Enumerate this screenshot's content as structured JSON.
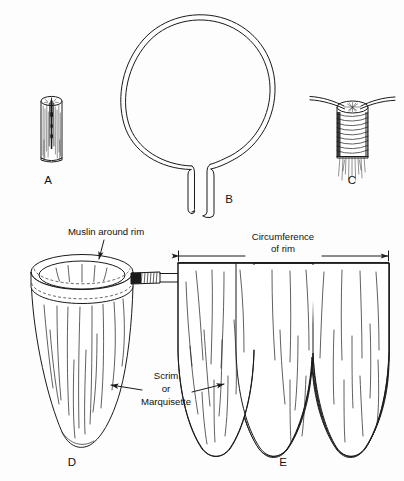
{
  "figure": {
    "kind": "technical-line-illustration",
    "background_color": "#fdfdfd",
    "ink_color": "#1a1a1a",
    "width": 404,
    "height": 481
  },
  "panels": [
    {
      "id": "A",
      "letter": "A",
      "name": "split-handle-end",
      "description": "Wooden handle end with sawn slot",
      "label_x": 48,
      "label_y": 181
    },
    {
      "id": "B",
      "letter": "B",
      "name": "wire-rim-hoop",
      "description": "Heavy wire bent into a rim hoop with two straight legs",
      "label_x": 229,
      "label_y": 200
    },
    {
      "id": "C",
      "letter": "C",
      "name": "wire-bound-to-handle",
      "description": "Wire legs seated in handle slot and bound with wire wrapping",
      "label_x": 352,
      "label_y": 181
    },
    {
      "id": "D",
      "letter": "D",
      "name": "assembled-net",
      "description": "Completed sweep net on rim and handle",
      "label_x": 72,
      "label_y": 463
    },
    {
      "id": "E",
      "letter": "E",
      "name": "net-bag-pattern",
      "description": "Flat cutting pattern for the net bag",
      "label_x": 283,
      "label_y": 463
    }
  ],
  "callouts": [
    {
      "id": "muslin",
      "name": "muslin-around-rim-callout",
      "text": "Muslin around rim",
      "text_x": 106,
      "text_y": 232,
      "arrow_from_x": 106,
      "arrow_from_y": 240,
      "arrow_to_x": 98,
      "arrow_to_y": 264
    },
    {
      "id": "scrim",
      "name": "scrim-or-marquisette-callout",
      "lines": [
        "Scrim",
        "or",
        "Marquisette"
      ],
      "text_x": 166,
      "text_y": 388,
      "line_height": 13,
      "arrow_left_from_x": 140,
      "arrow_left_from_y": 392,
      "arrow_left_to_x": 112,
      "arrow_left_to_y": 386,
      "arrow_right_from_x": 190,
      "arrow_right_from_y": 392,
      "arrow_right_to_x": 220,
      "arrow_right_to_y": 386
    }
  ],
  "dimensions": [
    {
      "id": "circumference",
      "name": "circumference-of-rim-dimension",
      "lines": [
        "Circumference",
        "of rim"
      ],
      "text_x": 283,
      "text_y": 243,
      "line_height": 12,
      "left_x": 178,
      "right_x": 389,
      "line_y": 256,
      "gap_left_x": 243,
      "gap_right_x": 323
    }
  ],
  "part_names": {
    "handle": "handle",
    "slot": "saw slot",
    "wire_rim": "wire rim",
    "binding_wire": "binding wire",
    "muslin_band": "muslin band",
    "net_bag": "net bag",
    "stitch_line": "stitching"
  }
}
